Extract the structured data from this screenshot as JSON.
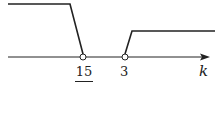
{
  "diagram": {
    "type": "number-line",
    "axis_label": "k",
    "points": [
      {
        "label_numerator": "15",
        "label_denominator": "7",
        "value": "15/7",
        "open": true
      },
      {
        "label": "3",
        "value": "3",
        "open": true
      }
    ],
    "regions": [
      {
        "range": "k < 15/7",
        "side": "left",
        "height": "high"
      },
      {
        "range": "k > 3",
        "side": "right",
        "height": "low"
      }
    ],
    "colors": {
      "line": "#222222",
      "background": "#ffffff"
    }
  }
}
